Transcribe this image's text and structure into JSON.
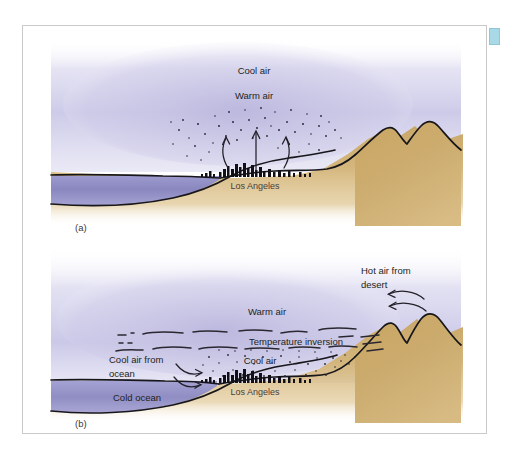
{
  "figure": {
    "domain_note": "Smog / temperature inversion diagram over Los Angeles",
    "panels": [
      {
        "id": "a",
        "caption": "(a)",
        "labels": {
          "cool_air": "Cool air",
          "warm_air": "Warm air",
          "city": "Los  Angeles"
        }
      },
      {
        "id": "b",
        "caption": "(b)",
        "labels": {
          "warm_air": "Warm air",
          "temperature_inversion": "Temperature inversion",
          "cool_air_from_ocean": "Cool air from\nocean",
          "cool_air_from_ocean_line1": "Cool air from",
          "cool_air_from_ocean_line2": "ocean",
          "cool_air": "Cool air",
          "hot_air_from_desert_line1": "Hot air from",
          "hot_air_from_desert_line2": "desert",
          "cold_ocean": "Cold ocean",
          "city": "Los  Angeles"
        }
      }
    ]
  },
  "colors": {
    "page_background": "#ffffff",
    "frame_border": "#c9c9c9",
    "sky_haze": "#c3c0e2",
    "ocean": "#8f8cc4",
    "cold_ocean": "#9a97cc",
    "land": "#cbab6e",
    "land_light": "#dcc089",
    "ink": "#17161a",
    "corner_marker": "#a9d8e6",
    "text": "#231f20"
  }
}
